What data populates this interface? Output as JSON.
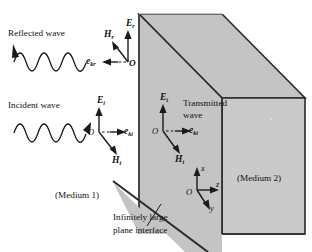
{
  "figure": {
    "colors": {
      "medium2_face": "#c9c9c9",
      "medium2_top": "#c2c2c2",
      "interface_face": "#c4c4c4",
      "outline": "#2b2b2b",
      "background": "#ffffff",
      "text": "#111111"
    }
  },
  "labels": {
    "reflected_wave": "Reflected wave",
    "incident_wave": "Incident wave",
    "transmitted_wave_line1": "Transmitted",
    "transmitted_wave_line2": "wave",
    "medium1": "(Medium 1)",
    "medium2": "(Medium 2)",
    "interface_line1": "Infinitely large",
    "interface_line2": "plane interface"
  },
  "vectors": {
    "reflected": {
      "E": "E",
      "E_sub": "r",
      "H": "H",
      "H_sub": "r",
      "k": "e",
      "k_sub": "kr",
      "origin": "O"
    },
    "incident": {
      "E": "E",
      "E_sub": "i",
      "H": "H",
      "H_sub": "i",
      "k": "e",
      "k_sub": "ki",
      "origin": "O"
    },
    "transmitted": {
      "E": "E",
      "E_sub": "t",
      "H": "H",
      "H_sub": "t",
      "k": "e",
      "k_sub": "kt",
      "origin": "O"
    }
  },
  "axes": {
    "x": "x",
    "y": "y",
    "z": "z",
    "origin": "O"
  }
}
